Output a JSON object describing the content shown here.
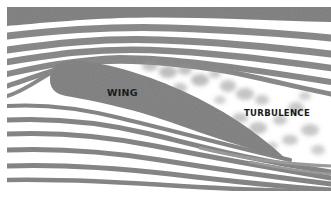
{
  "diagram": {
    "labels": {
      "wing": "WING",
      "turbulence": "TURBULENCE"
    },
    "colors": {
      "background": "#ffffff",
      "streamline": "#8f8f8f",
      "streamline_dark": "#6e6e6e",
      "wing_fill": "#8a8a8a",
      "turbulence_blob": "#9a9a9a",
      "label_text": "#1a1a1a"
    },
    "elements": [
      {
        "name": "wing",
        "shape": "airfoil",
        "angle": "tilted, leading edge upper-left, trailing edge lower-right"
      },
      {
        "name": "streamlines-above",
        "count": 6
      },
      {
        "name": "streamlines-below",
        "count": 7
      },
      {
        "name": "turbulence-region",
        "position": "above and behind wing"
      }
    ]
  }
}
